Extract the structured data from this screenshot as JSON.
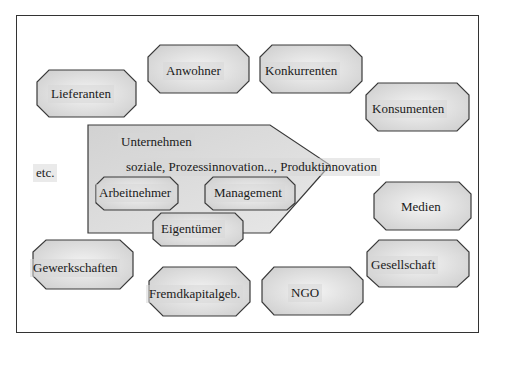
{
  "diagram": {
    "type": "stakeholder-diagram",
    "center": {
      "title": "Unternehmen",
      "subtitle": "soziale, Prozessinnovation..., Produktinnovation",
      "internal_stakeholders": [
        "Arbeitnehmer",
        "Management",
        "Eigentümer"
      ]
    },
    "external_stakeholders": [
      "Lieferanten",
      "Anwohner",
      "Konkurrenten",
      "Konsumenten",
      "Medien",
      "Gesellschaft",
      "NGO",
      "Fremdkapitalgeb.",
      "Gewerkschaften"
    ],
    "other": "etc."
  },
  "labels": {
    "lieferanten": "Lieferanten",
    "anwohner": "Anwohner",
    "konkurrenten": "Konkurrenten",
    "konsumenten": "Konsumenten",
    "unternehmen": "Unternehmen",
    "innovation": "soziale, Prozessinnovation..., Produktinnovation",
    "etc": "etc.",
    "arbeitnehmer": "Arbeitnehmer",
    "management": "Management",
    "eigentuemer": "Eigentümer",
    "medien": "Medien",
    "gewerkschaften": "Gewerkschaften",
    "gesellschaft": "Gesellschaft",
    "fremdkapital": "Fremdkapitalgeb.",
    "ngo": "NGO"
  },
  "colors": {
    "shape_fill": "#e6e6e6",
    "shape_stroke": "#3a3a3a",
    "frame_stroke": "#333333"
  }
}
